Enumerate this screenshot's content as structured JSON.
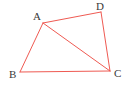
{
  "figure": {
    "type": "quadrilateral-with-diagonal",
    "canvas": {
      "width": 135,
      "height": 88
    },
    "background_color": "#ffffff",
    "stroke_color": "#ef5a52",
    "stroke_width": 1,
    "label_color": "#3a3a3a",
    "vertices": [
      {
        "id": "A",
        "label": "A",
        "x": 43,
        "y": 23,
        "label_x": 33,
        "label_y": 11
      },
      {
        "id": "B",
        "label": "B",
        "x": 20,
        "y": 72,
        "label_x": 9,
        "label_y": 69
      },
      {
        "id": "C",
        "label": "C",
        "x": 110,
        "y": 71,
        "label_x": 114,
        "label_y": 68
      },
      {
        "id": "D",
        "label": "D",
        "x": 101,
        "y": 12,
        "label_x": 96,
        "label_y": 1
      }
    ],
    "edges": [
      {
        "id": "AD",
        "from": "A",
        "to": "D"
      },
      {
        "id": "DC",
        "from": "D",
        "to": "C"
      },
      {
        "id": "CB",
        "from": "C",
        "to": "B"
      },
      {
        "id": "BA",
        "from": "B",
        "to": "A"
      },
      {
        "id": "AC",
        "from": "A",
        "to": "C",
        "role": "diagonal"
      }
    ]
  }
}
